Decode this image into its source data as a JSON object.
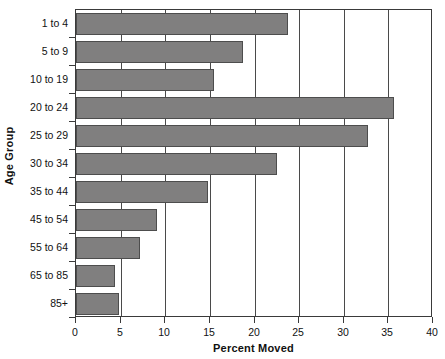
{
  "chart_data": {
    "type": "bar",
    "orientation": "horizontal",
    "title": "",
    "xlabel": "Percent Moved",
    "ylabel": "Age Group",
    "categories": [
      "1 to 4",
      "5 to 9",
      "10 to 19",
      "20 to 24",
      "25 to 29",
      "30 to 34",
      "35 to 44",
      "45 to 54",
      "55 to 64",
      "65 to 85",
      "85+"
    ],
    "values": [
      23.8,
      18.7,
      15.5,
      35.6,
      32.7,
      22.5,
      14.8,
      9.1,
      7.2,
      4.4,
      4.8
    ],
    "xlim": [
      0,
      40
    ],
    "xticks": [
      0,
      5,
      10,
      15,
      20,
      25,
      30,
      35,
      40
    ],
    "xtick_labels": [
      "0",
      "5",
      "10",
      "15",
      "20",
      "25",
      "30",
      "35",
      "40"
    ],
    "grid": "vertical",
    "legend": "none",
    "bar_color": "#807f7f",
    "bar_edge_color": "#4d4d4d",
    "axis_color": "#3a3a3a",
    "background_color": "#ffffff"
  }
}
